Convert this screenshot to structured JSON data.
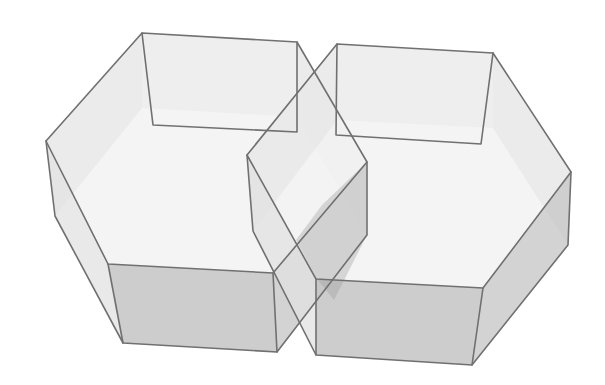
{
  "figure": {
    "colors": {
      "background": "#ffffff",
      "edge": "#707070",
      "top_face": "#f2f2f2",
      "side_light": "#e2e2e2",
      "side_mid": "#c4c4c4",
      "side_dark": "#a8a8a8",
      "overlap_dark": "#9a9a9a"
    },
    "prisms": [
      {
        "name": "left-prism",
        "top": [
          [
            142,
            33
          ],
          [
            297,
            42
          ],
          [
            367,
            162
          ],
          [
            273,
            273
          ],
          [
            108,
            264
          ],
          [
            46,
            141
          ]
        ],
        "bottom": [
          [
            142,
            108
          ],
          [
            297,
            117
          ],
          [
            367,
            235
          ],
          [
            277,
            352
          ],
          [
            123,
            343
          ],
          [
            55,
            216
          ]
        ],
        "inner_back": [
          [
            142,
            33
          ],
          [
            153,
            125
          ],
          [
            297,
            132
          ],
          [
            297,
            42
          ]
        ]
      },
      {
        "name": "right-prism",
        "top": [
          [
            337,
            44
          ],
          [
            493,
            53
          ],
          [
            571,
            172
          ],
          [
            483,
            288
          ],
          [
            316,
            279
          ],
          [
            247,
            155
          ]
        ],
        "bottom": [
          [
            337,
            120
          ],
          [
            493,
            128
          ],
          [
            568,
            245
          ],
          [
            472,
            365
          ],
          [
            316,
            355
          ],
          [
            253,
            231
          ]
        ],
        "inner_back": [
          [
            337,
            44
          ],
          [
            336,
            135
          ],
          [
            481,
            144
          ],
          [
            493,
            53
          ]
        ]
      }
    ]
  }
}
